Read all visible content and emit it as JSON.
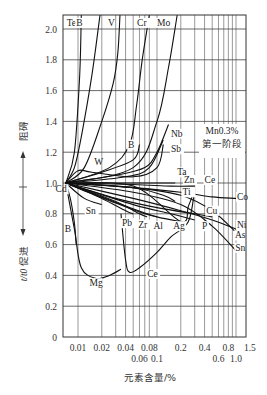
{
  "chart_data": {
    "type": "line",
    "title": "",
    "annotation": [
      "Mn0.3%",
      "第一阶段"
    ],
    "xlabel": "元素含量/%",
    "ylabel": "t/t0",
    "side_labels": {
      "up": "阻碍",
      "down": "促进"
    },
    "x_scale": "log",
    "xlim": [
      0.007,
      1.5
    ],
    "ylim": [
      0,
      2.1
    ],
    "grid": true,
    "x_ticks_row1": [
      "0.01",
      "0.02",
      "0.04",
      "0.08",
      "0.2",
      "0.4",
      "0.8",
      "1.5"
    ],
    "x_ticks_row2": [
      "0.06",
      "0.1",
      "0.6",
      "1.0"
    ],
    "x_gridlines": [
      0.01,
      0.02,
      0.03,
      0.04,
      0.05,
      0.06,
      0.07,
      0.08,
      0.1,
      0.2,
      0.3,
      0.4,
      0.5,
      0.6,
      0.7,
      0.8,
      0.9,
      1.0,
      1.5
    ],
    "y_ticks": [
      "0",
      "0.2",
      "0.4",
      "0.6",
      "0.8",
      "1.0",
      "1.2",
      "1.4",
      "1.6",
      "1.8",
      "2.0"
    ],
    "series": [
      {
        "name": "Te",
        "x": [
          0.007,
          0.009,
          0.0105,
          0.011
        ],
        "y": [
          1.0,
          1.2,
          1.7,
          2.1
        ]
      },
      {
        "name": "B (upper)",
        "x": [
          0.007,
          0.009,
          0.011,
          0.015,
          0.019
        ],
        "y": [
          1.0,
          1.1,
          1.3,
          1.7,
          2.1
        ]
      },
      {
        "name": "V",
        "x": [
          0.007,
          0.012,
          0.02,
          0.028,
          0.032,
          0.034
        ],
        "y": [
          1.0,
          1.1,
          1.4,
          1.65,
          1.85,
          2.1
        ]
      },
      {
        "name": "Cr",
        "x": [
          0.007,
          0.025,
          0.045,
          0.055,
          0.065,
          0.08
        ],
        "y": [
          1.0,
          1.1,
          1.25,
          1.5,
          1.8,
          2.1
        ]
      },
      {
        "name": "Mo",
        "x": [
          0.007,
          0.05,
          0.1,
          0.14,
          0.18
        ],
        "y": [
          1.0,
          1.1,
          1.4,
          1.75,
          2.1
        ]
      },
      {
        "name": "B",
        "x": [
          0.007,
          0.02,
          0.05,
          0.06
        ],
        "y": [
          1.0,
          1.07,
          1.15,
          1.25
        ]
      },
      {
        "name": "Nb",
        "x": [
          0.007,
          0.03,
          0.07,
          0.1,
          0.14
        ],
        "y": [
          1.0,
          1.05,
          1.1,
          1.2,
          1.38
        ]
      },
      {
        "name": "Sb",
        "x": [
          0.007,
          0.04,
          0.08,
          0.12
        ],
        "y": [
          1.0,
          1.04,
          1.1,
          1.28
        ]
      },
      {
        "name": "W",
        "x": [
          0.007,
          0.01,
          0.015,
          0.05,
          0.1,
          0.12
        ],
        "y": [
          1.0,
          1.08,
          1.07,
          1.04,
          1.1,
          1.25
        ]
      },
      {
        "name": "Ta",
        "x": [
          0.007,
          0.05,
          0.12,
          0.17
        ],
        "y": [
          1.0,
          1.0,
          1.0,
          1.0
        ]
      },
      {
        "name": "Zn",
        "x": [
          0.007,
          0.05,
          0.15,
          0.3
        ],
        "y": [
          1.0,
          0.99,
          0.98,
          0.98
        ]
      },
      {
        "name": "Ce (right)",
        "x": [
          0.007,
          0.05,
          0.2,
          0.25,
          0.3
        ],
        "y": [
          1.0,
          0.98,
          0.75,
          0.85,
          0.96
        ]
      },
      {
        "name": "Co",
        "x": [
          0.007,
          0.05,
          0.2,
          0.5,
          1.0
        ],
        "y": [
          1.0,
          0.97,
          0.94,
          0.91,
          0.9
        ]
      },
      {
        "name": "Ti",
        "x": [
          0.007,
          0.05,
          0.12,
          0.17
        ],
        "y": [
          1.0,
          0.97,
          0.92,
          0.88
        ]
      },
      {
        "name": "Cu",
        "x": [
          0.007,
          0.03,
          0.1,
          0.3,
          0.5
        ],
        "y": [
          1.0,
          0.9,
          0.84,
          0.8,
          0.78
        ]
      },
      {
        "name": "Ni",
        "x": [
          0.007,
          0.05,
          0.2,
          0.5,
          1.0
        ],
        "y": [
          1.0,
          0.9,
          0.82,
          0.76,
          0.7
        ]
      },
      {
        "name": "As",
        "x": [
          0.007,
          0.05,
          0.2,
          0.5,
          1.0
        ],
        "y": [
          1.0,
          0.97,
          0.92,
          0.82,
          0.68
        ]
      },
      {
        "name": "Sn",
        "x": [
          0.007,
          0.05,
          0.2,
          0.5,
          1.0
        ],
        "y": [
          1.0,
          0.94,
          0.86,
          0.72,
          0.56
        ]
      },
      {
        "name": "P",
        "x": [
          0.007,
          0.05,
          0.15,
          0.3
        ],
        "y": [
          1.0,
          0.86,
          0.8,
          0.76
        ]
      },
      {
        "name": "Ag",
        "x": [
          0.007,
          0.04,
          0.1,
          0.2
        ],
        "y": [
          1.0,
          0.85,
          0.78,
          0.75
        ]
      },
      {
        "name": "Al",
        "x": [
          0.007,
          0.03,
          0.07,
          0.1
        ],
        "y": [
          1.0,
          0.87,
          0.8,
          0.78
        ]
      },
      {
        "name": "Zr",
        "x": [
          0.007,
          0.03,
          0.06,
          0.075
        ],
        "y": [
          1.0,
          0.88,
          0.8,
          0.78
        ]
      },
      {
        "name": "Pb",
        "x": [
          0.007,
          0.02,
          0.04,
          0.05
        ],
        "y": [
          1.0,
          0.9,
          0.82,
          0.8
        ]
      },
      {
        "name": "Sn (short)",
        "x": [
          0.007,
          0.012,
          0.02
        ],
        "y": [
          1.0,
          0.9,
          0.86
        ]
      },
      {
        "name": "Cd",
        "x": [
          0.007,
          0.0075
        ],
        "y": [
          1.0,
          0.97
        ]
      },
      {
        "name": "B (lower)",
        "x": [
          0.007,
          0.008,
          0.009,
          0.0095
        ],
        "y": [
          1.0,
          0.9,
          0.74,
          0.6
        ]
      },
      {
        "name": "Mg",
        "x": [
          0.007,
          0.009,
          0.011,
          0.017,
          0.025,
          0.035
        ],
        "y": [
          1.0,
          0.7,
          0.45,
          0.38,
          0.4,
          0.44
        ]
      },
      {
        "name": "Ce",
        "x": [
          0.035,
          0.04,
          0.045,
          0.06,
          0.1,
          0.15,
          0.25,
          0.3
        ],
        "y": [
          0.8,
          0.5,
          0.42,
          0.45,
          0.55,
          0.65,
          0.75,
          0.96
        ]
      }
    ],
    "labels": [
      {
        "text": "Te",
        "x": 0.0072,
        "y": 2.02
      },
      {
        "text": "B",
        "x": 0.0095,
        "y": 2.02
      },
      {
        "text": "V",
        "x": 0.024,
        "y": 2.02
      },
      {
        "text": "Cr",
        "x": 0.056,
        "y": 2.02
      },
      {
        "text": "Mo",
        "x": 0.1,
        "y": 2.02
      },
      {
        "text": "B",
        "x": 0.043,
        "y": 1.23
      },
      {
        "text": "Nb",
        "x": 0.15,
        "y": 1.3
      },
      {
        "text": "Sb",
        "x": 0.15,
        "y": 1.2
      },
      {
        "text": "W",
        "x": 0.016,
        "y": 1.12
      },
      {
        "text": "Ta",
        "x": 0.18,
        "y": 1.05
      },
      {
        "text": "Zn",
        "x": 0.22,
        "y": 1.0
      },
      {
        "text": "Ce",
        "x": 0.4,
        "y": 1.0
      },
      {
        "text": "Co",
        "x": 1.03,
        "y": 0.89
      },
      {
        "text": "Ti",
        "x": 0.21,
        "y": 0.92
      },
      {
        "text": "Cu",
        "x": 0.42,
        "y": 0.8
      },
      {
        "text": "Ni",
        "x": 1.03,
        "y": 0.71
      },
      {
        "text": "As",
        "x": 0.97,
        "y": 0.64
      },
      {
        "text": "Sn",
        "x": 0.98,
        "y": 0.56
      },
      {
        "text": "P",
        "x": 0.37,
        "y": 0.7
      },
      {
        "text": "Ag",
        "x": 0.16,
        "y": 0.7
      },
      {
        "text": "Al",
        "x": 0.09,
        "y": 0.7
      },
      {
        "text": "Zr",
        "x": 0.058,
        "y": 0.71
      },
      {
        "text": "Pb",
        "x": 0.036,
        "y": 0.72
      },
      {
        "text": "Sn",
        "x": 0.0125,
        "y": 0.8
      },
      {
        "text": "Cd",
        "x": 0.0052,
        "y": 0.94
      },
      {
        "text": "B",
        "x": 0.0068,
        "y": 0.68
      },
      {
        "text": "Mg",
        "x": 0.014,
        "y": 0.33
      },
      {
        "text": "Ce",
        "x": 0.075,
        "y": 0.39
      }
    ]
  }
}
